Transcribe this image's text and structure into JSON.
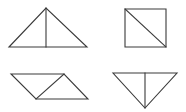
{
  "canvas": {
    "width": 186,
    "height": 112,
    "background_color": "#ffffff",
    "stroke_color": "#3a3a3a",
    "stroke_width": 1.1
  },
  "figures": [
    {
      "id": "figure-1",
      "name": "isosceles-triangle-with-vertical-median",
      "position": "top-left",
      "outline_points": "9,47 46,8 87,47",
      "inner_line": {
        "x1": 46,
        "y1": 8,
        "x2": 46,
        "y2": 47
      },
      "inner_line_name": "vertical-median"
    },
    {
      "id": "figure-2",
      "name": "square-with-diagonal",
      "position": "top-right",
      "outline_points": "125,9 166,9 166,47 125,47",
      "inner_line": {
        "x1": 125,
        "y1": 9,
        "x2": 166,
        "y2": 47
      },
      "inner_line_name": "diagonal-top-left-to-bottom-right"
    },
    {
      "id": "figure-3",
      "name": "parallelogram-with-diagonal",
      "position": "bottom-left",
      "outline_points": "11,74 64,74 88,99 36,99",
      "inner_line": {
        "x1": 64,
        "y1": 74,
        "x2": 36,
        "y2": 99
      },
      "inner_line_name": "diagonal-top-right-to-bottom-left"
    },
    {
      "id": "figure-4",
      "name": "inverted-triangle-with-vertical-median",
      "position": "bottom-right",
      "outline_points": "113,73 177,73 145,108",
      "inner_line": {
        "x1": 145,
        "y1": 73,
        "x2": 145,
        "y2": 108
      },
      "inner_line_name": "vertical-median"
    }
  ]
}
